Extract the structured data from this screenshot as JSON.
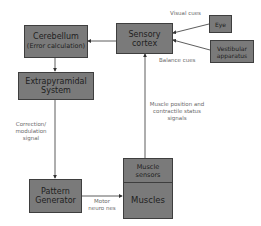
{
  "diagram": {
    "nodes": {
      "cerebellum": {
        "line1": "Cerebellum",
        "line2": "(Error calculation)"
      },
      "sensory_cortex": {
        "line1": "Sensory",
        "line2": "cortex"
      },
      "eye": {
        "label": "Eye"
      },
      "vestibular": {
        "line1": "Vestibular",
        "line2": "apparatus"
      },
      "extrapyramidal": {
        "line1": "Extrapyramidal",
        "line2": "System"
      },
      "pattern_generator": {
        "line1": "Pattern",
        "line2": "Generator"
      },
      "muscle_sensors": {
        "line1": "Muscle",
        "line2": "sensors"
      },
      "muscles": {
        "label": "Muscles"
      }
    },
    "edge_labels": {
      "visual_cues": "Visual cues",
      "balance_cues": "Balance cues",
      "correction": {
        "line1": "Correction/",
        "line2": "modulation",
        "line3": "signal"
      },
      "motor": {
        "line1": "Motor",
        "line2": "neuro nes"
      },
      "muscle_position": {
        "line1": "Muscle position and",
        "line2": "contractile status",
        "line3": "signals"
      }
    },
    "colors": {
      "box_fill": "#7a7a7a",
      "box_border": "#3e3e3e",
      "line": "#333333",
      "label_text": "#6a6a6a"
    }
  }
}
